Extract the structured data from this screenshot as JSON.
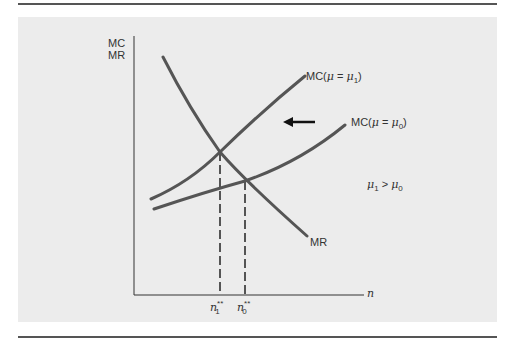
{
  "diagram": {
    "y_axis_label_line1": "MC",
    "y_axis_label_line2": "MR",
    "x_axis_label": "n",
    "curves": {
      "mc_mu1": {
        "prefix": "MC(",
        "mu": "μ",
        "eq": " = ",
        "mu2": "μ",
        "sub": "1",
        "suffix": ")"
      },
      "mc_mu0": {
        "prefix": "MC(",
        "mu": "μ",
        "eq": " = ",
        "mu2": "μ",
        "sub": "0",
        "suffix": ")"
      },
      "mr": "MR"
    },
    "condition": {
      "a": "μ",
      "a_sub": "1",
      "op": " > ",
      "b": "μ",
      "b_sub": "0"
    },
    "ticks": [
      {
        "base": "n",
        "sup": "**",
        "sub": "1"
      },
      {
        "base": "n",
        "sup": "**",
        "sub": "0"
      }
    ],
    "shift_arrow": "left",
    "colors": {
      "curve": "#555555",
      "axis": "#333333",
      "panel": "#ececec",
      "rule": "#555555"
    }
  }
}
